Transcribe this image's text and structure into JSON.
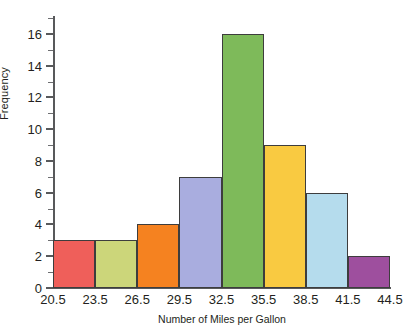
{
  "chart_data": {
    "type": "bar",
    "title": "",
    "subtitle": "",
    "xlabel": "Number of Miles per Gallon",
    "ylabel": "Frequency",
    "categories": [
      "20.5-23.5",
      "23.5-26.5",
      "26.5-29.5",
      "29.5-32.5",
      "32.5-35.5",
      "35.5-38.5",
      "38.5-41.5",
      "41.5-44.5"
    ],
    "bin_edges": [
      20.5,
      23.5,
      26.5,
      29.5,
      32.5,
      35.5,
      38.5,
      41.5,
      44.5
    ],
    "values": [
      3,
      3,
      4,
      7,
      16,
      9,
      6,
      2
    ],
    "bar_colors": [
      "#ef5f5a",
      "#ccd67a",
      "#f58220",
      "#a9addf",
      "#7eba5a",
      "#f9ca41",
      "#b5dced",
      "#9e4f9e"
    ],
    "bar_border_color": "#3d3d3d",
    "xlim": [
      20.5,
      44.5
    ],
    "ylim": [
      0,
      17
    ],
    "x_tick_labels": [
      "20.5",
      "23.5",
      "26.5",
      "29.5",
      "32.5",
      "35.5",
      "38.5",
      "41.5",
      "44.5"
    ],
    "y_tick_labels": [
      "0",
      "2",
      "4",
      "6",
      "8",
      "10",
      "12",
      "14",
      "16"
    ],
    "y_tick_values": [
      0,
      2,
      4,
      6,
      8,
      10,
      12,
      14,
      16
    ],
    "y_minor_tick_values": [
      1,
      3,
      5,
      7,
      9,
      11,
      13,
      15,
      17
    ],
    "grid": false,
    "legend": false,
    "axis_color": "#58595b",
    "text_color": "#231f20"
  }
}
